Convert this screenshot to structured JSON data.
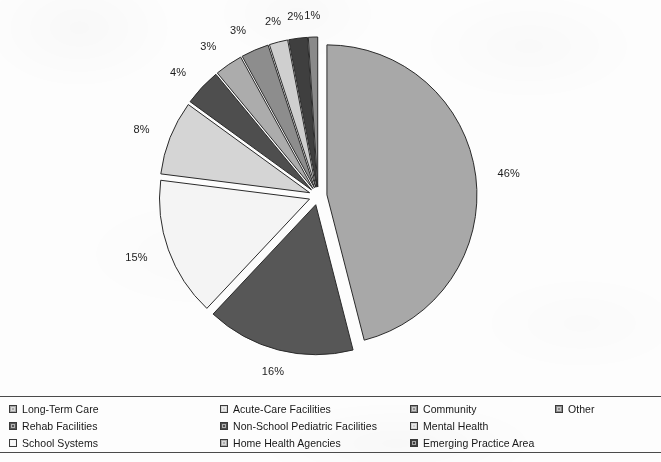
{
  "chart_data": {
    "type": "pie",
    "title": "",
    "subtitle": "",
    "xlabel": "",
    "ylabel": "",
    "legend_position": "bottom",
    "grid": false,
    "exploded": true,
    "value_unit": "%",
    "categories": [
      "Long-Term Care",
      "Rehab Facilities",
      "School Systems",
      "Acute-Care Facilities",
      "Non-School Pediatric Facilities",
      "Home Health Agencies",
      "Community",
      "Mental Health",
      "Emerging Practice Area",
      "Other"
    ],
    "values": [
      46,
      16,
      15,
      8,
      4,
      3,
      3,
      2,
      2,
      1
    ],
    "labels": [
      "46%",
      "16%",
      "15%",
      "8%",
      "4%",
      "3%",
      "3%",
      "2%",
      "2%",
      "1%"
    ],
    "colors": [
      "#a8a8a8",
      "#575757",
      "#f4f4f4",
      "#d5d5d5",
      "#4e4e4e",
      "#acacac",
      "#8d8d8d",
      "#cfcfcf",
      "#3f3f3f",
      "#8a8a8a"
    ],
    "slice_outline_color": "#2b2b2b"
  },
  "legend": {
    "items": [
      {
        "label": "Long-Term Care",
        "color": "#a8a8a8",
        "value": 46
      },
      {
        "label": "Rehab Facilities",
        "color": "#575757",
        "value": 16
      },
      {
        "label": "School Systems",
        "color": "#f4f4f4",
        "value": 15
      },
      {
        "label": "Acute-Care Facilities",
        "color": "#d5d5d5",
        "value": 8
      },
      {
        "label": "Non-School Pediatric Facilities",
        "color": "#4e4e4e",
        "value": 4
      },
      {
        "label": "Home Health Agencies",
        "color": "#acacac",
        "value": 3
      },
      {
        "label": "Community",
        "color": "#8d8d8d",
        "value": 3
      },
      {
        "label": "Mental Health",
        "color": "#cfcfcf",
        "value": 2
      },
      {
        "label": "Emerging Practice Area",
        "color": "#3f3f3f",
        "value": 2
      },
      {
        "label": "Other",
        "color": "#8a8a8a",
        "value": 1
      }
    ]
  },
  "geometry": {
    "center_x": 318,
    "center_y": 196,
    "radius": 150,
    "explode_offset": 9,
    "start_angle_deg": -90,
    "label_radius": 172
  }
}
